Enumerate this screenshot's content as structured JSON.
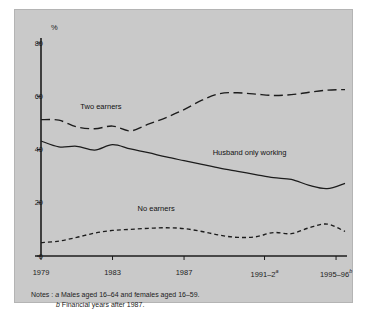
{
  "chart_data": {
    "type": "line",
    "title": "",
    "xlabel": "",
    "ylabel": "%",
    "ylim": [
      0,
      80
    ],
    "xlim": [
      1979,
      1996
    ],
    "yticks": [
      0,
      20,
      40,
      60,
      80
    ],
    "ytick_labels": [
      "0",
      "20",
      "40",
      "60",
      "80"
    ],
    "xtick_values": [
      1979,
      1983,
      1987,
      1991.5,
      1995.5
    ],
    "xtick_labels": [
      "1979",
      "1983",
      "1987",
      "1991–2",
      "1995–96"
    ],
    "xtick_superscripts": [
      "",
      "",
      "",
      "a",
      "b"
    ],
    "grid": false,
    "legend_position": "inline-annotations",
    "x": [
      1979,
      1980,
      1981,
      1982,
      1983,
      1984,
      1985,
      1986,
      1987,
      1988,
      1989,
      1990,
      1991,
      1992,
      1993,
      1994,
      1995,
      1996
    ],
    "series": [
      {
        "name": "Two earners",
        "style": "long-dash",
        "values": [
          51.2,
          51.0,
          48.5,
          47.8,
          48.8,
          47.0,
          49.5,
          52.0,
          55.0,
          58.5,
          61.0,
          61.3,
          60.8,
          60.3,
          60.6,
          61.5,
          62.3,
          62.5
        ]
      },
      {
        "name": "Husband only working",
        "style": "solid",
        "values": [
          43.2,
          41.0,
          41.2,
          39.8,
          41.8,
          40.2,
          38.8,
          37.2,
          35.8,
          34.4,
          33.0,
          31.8,
          30.6,
          29.4,
          28.8,
          26.5,
          25.3,
          27.3
        ]
      },
      {
        "name": "No earners",
        "style": "short-dash",
        "values": [
          5.0,
          5.6,
          7.0,
          8.6,
          9.6,
          10.0,
          10.4,
          10.6,
          10.3,
          9.2,
          7.8,
          7.0,
          7.2,
          8.8,
          8.4,
          10.6,
          12.0,
          9.2
        ]
      }
    ],
    "annotations": [
      {
        "text": "Two earners",
        "x": 1981.2,
        "y": 56.0
      },
      {
        "text": "Husband only working",
        "x": 1988.6,
        "y": 38.5
      },
      {
        "text": "No earners",
        "x": 1984.4,
        "y": 17.5
      }
    ],
    "notes": [
      "Notes :  a Males aged 16–64 and females aged 16–59.",
      "b Financial years after 1987."
    ]
  },
  "axis": {
    "unit_label": "%"
  },
  "notes": {
    "line1_prefix": "Notes :",
    "line1_marker": "a",
    "line1_text": "Males aged 16–64 and females aged 16–59.",
    "line2_marker": "b",
    "line2_text": "Financial years after 1987."
  },
  "colors": {
    "background": "#c9c9c9",
    "line": "#1c1c1c",
    "text": "#1c1c1c"
  }
}
